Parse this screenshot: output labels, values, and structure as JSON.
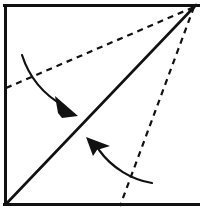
{
  "canvas": {
    "width": 200,
    "height": 215,
    "background": "#ffffff"
  },
  "figure": {
    "ink_color": "#111111",
    "paper_fill": "#ffffff"
  },
  "sheet": {
    "name": "paper-square",
    "left": 4,
    "top": 4,
    "right": 197,
    "bottom": 206,
    "stroke_color": "#111111",
    "stroke_width": 3,
    "edges": {
      "top_visible": true,
      "left_visible": true,
      "bottom_visible": true,
      "right_visible": false
    }
  },
  "lines": [
    {
      "name": "main-fold-line",
      "kind": "solid",
      "label": "diagonal valley fold",
      "x1": 7,
      "y1": 203,
      "x2": 196,
      "y2": 5,
      "stroke_width": 2.6,
      "color": "#111111"
    },
    {
      "name": "crease-guide-upper",
      "kind": "dashed",
      "label": "upper dashed crease guide",
      "x1": 6,
      "y1": 88,
      "x2": 194,
      "y2": 7,
      "stroke_width": 2.2,
      "color": "#111111",
      "dash": "6 5"
    },
    {
      "name": "crease-guide-lower",
      "kind": "dashed",
      "label": "lower dashed crease guide",
      "x1": 194,
      "y1": 7,
      "x2": 120,
      "y2": 206,
      "stroke_width": 2.2,
      "color": "#111111",
      "dash": "6 5"
    }
  ],
  "arrows": [
    {
      "name": "fold-arrow-upper",
      "label": "upper fold direction arrow",
      "direction": "down-right",
      "path": "M 22 55 C 30 80, 46 96, 64 106",
      "stroke_width": 2.2,
      "color": "#111111",
      "head": {
        "name": "arrowhead-down-right",
        "points": "55,96 78,116 62,118 58,113",
        "tip_x": 78,
        "tip_y": 116,
        "fill": "#111111"
      }
    },
    {
      "name": "fold-arrow-lower",
      "label": "lower fold direction arrow",
      "direction": "up-left",
      "path": "M 152 183 C 132 180, 112 168, 99 150",
      "stroke_width": 2.2,
      "color": "#111111",
      "head": {
        "name": "arrowhead-up-left",
        "points": "86,137 110,146 97,150 93,156",
        "tip_x": 86,
        "tip_y": 137,
        "fill": "#111111"
      }
    }
  ]
}
